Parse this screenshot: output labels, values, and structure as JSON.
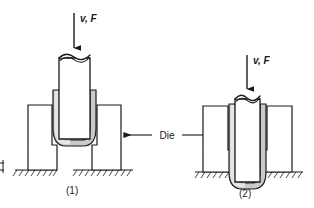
{
  "figure": {
    "background_color": "#ffffff",
    "line_color": "#1a1a1a",
    "sheet_metal_color": "#c9c9c9",
    "sheet_metal_highlight": "#e8e8e8",
    "punch_fill": "#ffffff",
    "die_fill": "#ffffff"
  },
  "labels": {
    "force_left": "v, F",
    "force_right": "v, F",
    "die": "Die",
    "stage_one": "(1)",
    "stage_two": "(2)"
  },
  "icons": {
    "force_arrow": "down-arrow-icon",
    "die_pointer_left": "left-arrow-icon",
    "die_pointer_right": "right-arrow-icon",
    "ground": "ground-hatch-icon"
  },
  "stages": [
    {
      "id": "stage-1",
      "caption": "(1)",
      "force_label": "v, F",
      "description": "Punch descending, blank seated on die with flange on die faces"
    },
    {
      "id": "stage-2",
      "caption": "(2)",
      "force_label": "v, F",
      "description": "Punch advanced, cup drawn through die cavity"
    }
  ]
}
